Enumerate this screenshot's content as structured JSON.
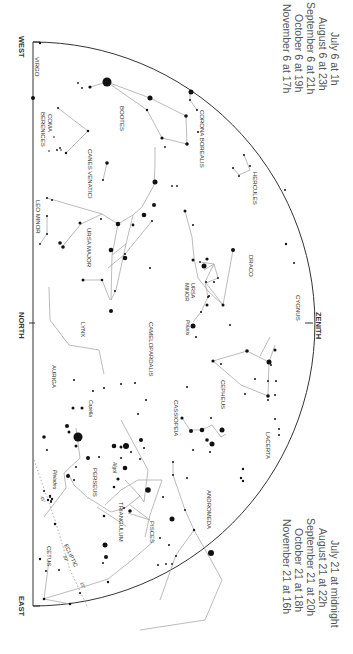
{
  "title_blocks": {
    "top": [
      "July 6 at   1h",
      "August 6 at 23h",
      "September 6 at 21h",
      "October 6 at 19h",
      "November 6 at 17h"
    ],
    "bottom": [
      "July 21 at midnight",
      "August 21 at        22h",
      "September 21 at    20h",
      "October 21 at       18h",
      "November 21 at      16h"
    ]
  },
  "directions": {
    "west": "WEST",
    "north": "NORTH",
    "east": "EAST",
    "zenith": "ZENITH"
  },
  "constellations": {
    "virgo": "VIRGO",
    "bootes": "BOOTES",
    "corona_borealis": "CORONA BOREALIS",
    "coma_berenices_1": "COMA",
    "coma_berenices_2": "BERENICES",
    "hercules": "HERCULES",
    "canes_venatici": "CANES VENATICI",
    "leo_minor": "LEO MINOR",
    "ursa_major": "URSA MAJOR",
    "draco": "DRACO",
    "ursa_minor_1": "URSA",
    "ursa_minor_2": "MINOR",
    "cygnus": "CYGNUS",
    "lynx": "LYNX",
    "camelopardalis": "CAMELOPARDALIS",
    "cepheus": "CEPHEUS",
    "auriga": "AURIGA",
    "cassiopeia": "CASSIOPEIA",
    "lacerta": "LACERTA",
    "perseus": "PERSEUS",
    "andromeda": "ANDROMEDA",
    "triangulum": "TRIANGULUM",
    "pisces": "PISCES",
    "cetus": "CETUS",
    "ecliptic": "ECLIPTIC"
  },
  "stars": {
    "arcturus": "Arcturus",
    "polaris": "Polaris",
    "capella": "Capella",
    "algol": "Algol",
    "pleiades": "Pleiades"
  },
  "ecliptic_marks": [
    "45°",
    "30°",
    "15°"
  ],
  "colors": {
    "line": "#aaaaaa",
    "horizon": "#333333",
    "star": "#111111",
    "text": "#444444"
  }
}
